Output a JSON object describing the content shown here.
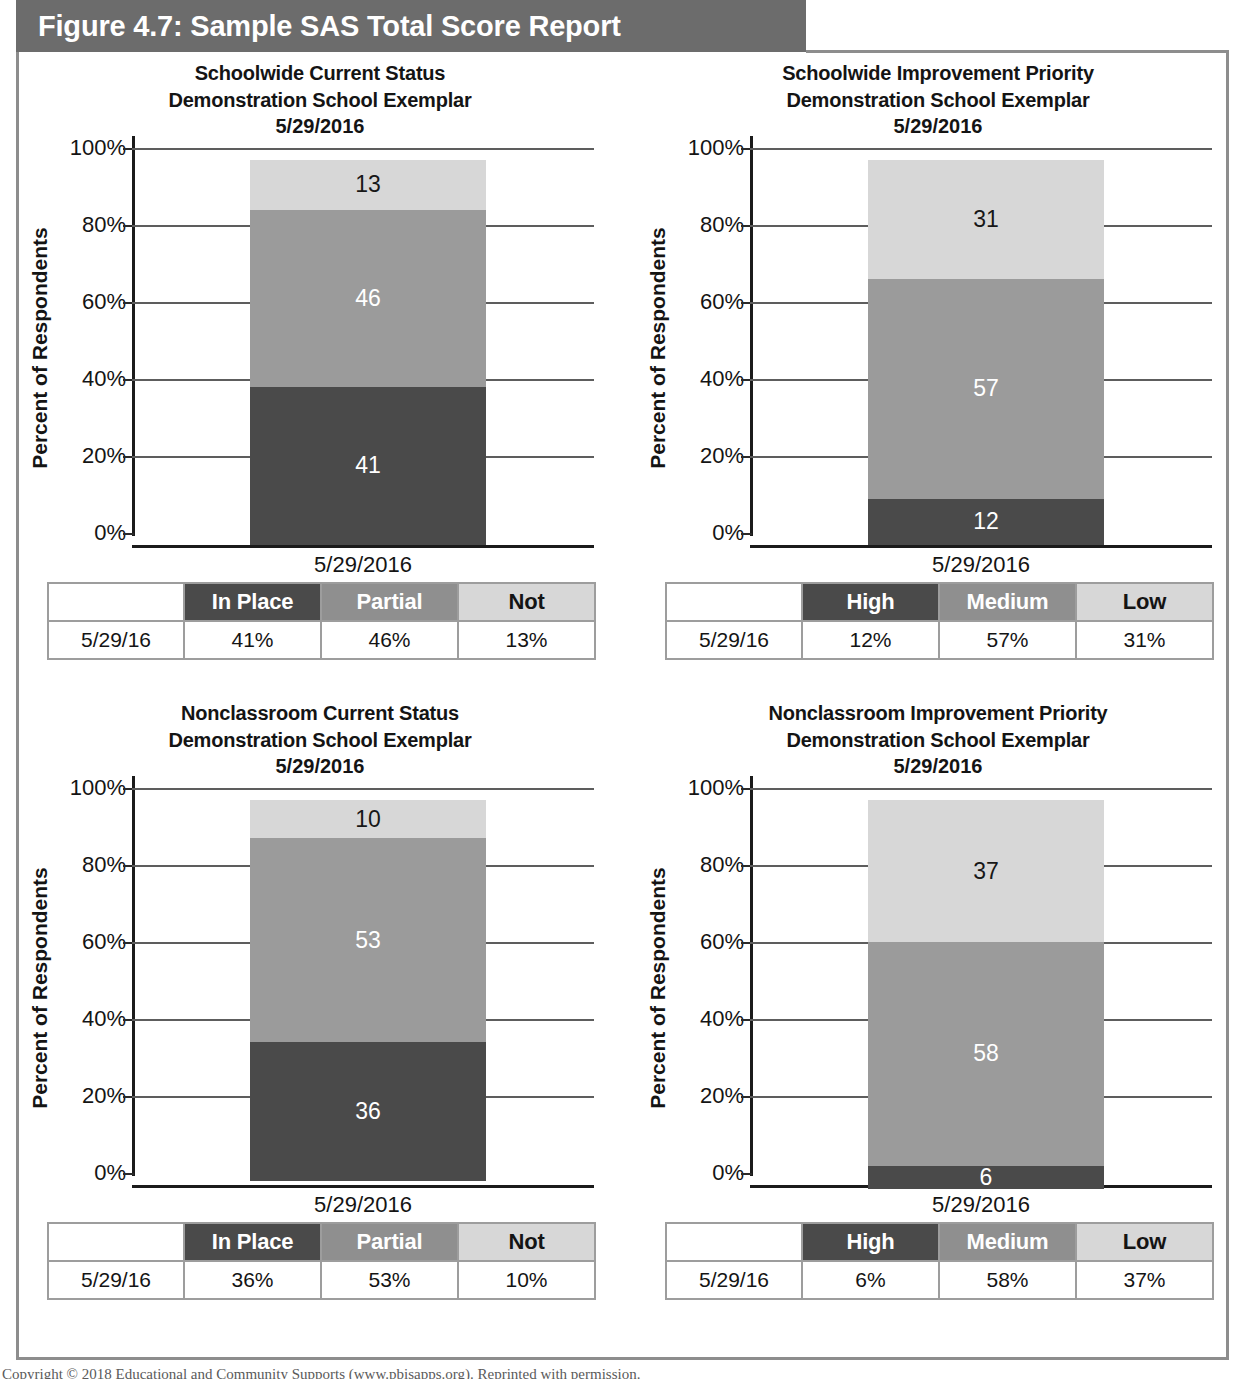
{
  "figure": {
    "banner_title": "Figure 4.7: Sample SAS Total Score Report",
    "footer": "Copyright © 2018 Educational and Community Supports (www.pbisapps.org). Reprinted with permission."
  },
  "colors": {
    "banner_bg": "#6c6c6c",
    "frame_border": "#8d8d8d",
    "segment_dark": "#4a4a4a",
    "segment_medium": "#9b9b9b",
    "segment_light": "#d7d7d7",
    "axis": "#1b1b1b",
    "gridline": "#5d5d5d",
    "text": "#141414"
  },
  "axis_common": {
    "ylabel": "Percent of Respondents",
    "tick_labels": [
      "100%",
      "80%",
      "60%",
      "40%",
      "20%",
      "0%"
    ],
    "tick_values": [
      100,
      80,
      60,
      40,
      20,
      0
    ]
  },
  "panels": [
    {
      "id": "schoolwide-current-status",
      "title_line1": "Schoolwide Current Status",
      "title_line2": "Demonstration School Exemplar",
      "title_line3": "5/29/2016",
      "xcat": "5/29/2016",
      "legend": {
        "row_label": "5/29/16",
        "headers": [
          "In Place",
          "Partial",
          "Not"
        ],
        "values": [
          "41%",
          "46%",
          "13%"
        ]
      }
    },
    {
      "id": "schoolwide-improvement-priority",
      "title_line1": "Schoolwide Improvement Priority",
      "title_line2": "Demonstration School Exemplar",
      "title_line3": "5/29/2016",
      "xcat": "5/29/2016",
      "legend": {
        "row_label": "5/29/16",
        "headers": [
          "High",
          "Medium",
          "Low"
        ],
        "values": [
          "12%",
          "57%",
          "31%"
        ]
      }
    },
    {
      "id": "nonclassroom-current-status",
      "title_line1": "Nonclassroom Current Status",
      "title_line2": "Demonstration School Exemplar",
      "title_line3": "5/29/2016",
      "xcat": "5/29/2016",
      "legend": {
        "row_label": "5/29/16",
        "headers": [
          "In Place",
          "Partial",
          "Not"
        ],
        "values": [
          "36%",
          "53%",
          "10%"
        ]
      }
    },
    {
      "id": "nonclassroom-improvement-priority",
      "title_line1": "Nonclassroom Improvement Priority",
      "title_line2": "Demonstration School Exemplar",
      "title_line3": "5/29/2016",
      "xcat": "5/29/2016",
      "legend": {
        "row_label": "5/29/16",
        "headers": [
          "High",
          "Medium",
          "Low"
        ],
        "values": [
          "6%",
          "58%",
          "37%"
        ]
      }
    }
  ],
  "chart_data": [
    {
      "type": "bar",
      "stacked": true,
      "percent": true,
      "title": "Schoolwide Current Status Demonstration School Exemplar 5/29/2016",
      "xlabel": "",
      "ylabel": "Percent of Respondents",
      "categories": [
        "5/29/2016"
      ],
      "ylim": [
        0,
        100
      ],
      "yticks": [
        0,
        20,
        40,
        60,
        80,
        100
      ],
      "ytick_labels": [
        "0%",
        "20%",
        "40%",
        "60%",
        "80%",
        "100%"
      ],
      "grid": true,
      "legend_position": "table-below",
      "series": [
        {
          "name": "In Place",
          "values": [
            41
          ],
          "label": "41",
          "color": "#4a4a4a",
          "label_color": "#ffffff"
        },
        {
          "name": "Partial",
          "values": [
            46
          ],
          "label": "46",
          "color": "#9b9b9b",
          "label_color": "#ffffff"
        },
        {
          "name": "Not",
          "values": [
            13
          ],
          "label": "13",
          "color": "#d7d7d7",
          "label_color": "#171717"
        }
      ]
    },
    {
      "type": "bar",
      "stacked": true,
      "percent": true,
      "title": "Schoolwide Improvement Priority Demonstration School Exemplar 5/29/2016",
      "xlabel": "",
      "ylabel": "Percent of Respondents",
      "categories": [
        "5/29/2016"
      ],
      "ylim": [
        0,
        100
      ],
      "yticks": [
        0,
        20,
        40,
        60,
        80,
        100
      ],
      "ytick_labels": [
        "0%",
        "20%",
        "40%",
        "60%",
        "80%",
        "100%"
      ],
      "grid": true,
      "legend_position": "table-below",
      "series": [
        {
          "name": "High",
          "values": [
            12
          ],
          "label": "12",
          "color": "#4a4a4a",
          "label_color": "#ffffff"
        },
        {
          "name": "Medium",
          "values": [
            57
          ],
          "label": "57",
          "color": "#9b9b9b",
          "label_color": "#ffffff"
        },
        {
          "name": "Low",
          "values": [
            31
          ],
          "label": "31",
          "color": "#d7d7d7",
          "label_color": "#171717"
        }
      ]
    },
    {
      "type": "bar",
      "stacked": true,
      "percent": true,
      "title": "Nonclassroom Current Status Demonstration School Exemplar 5/29/2016",
      "xlabel": "",
      "ylabel": "Percent of Respondents",
      "categories": [
        "5/29/2016"
      ],
      "ylim": [
        0,
        100
      ],
      "yticks": [
        0,
        20,
        40,
        60,
        80,
        100
      ],
      "ytick_labels": [
        "0%",
        "20%",
        "40%",
        "60%",
        "80%",
        "100%"
      ],
      "grid": true,
      "legend_position": "table-below",
      "series": [
        {
          "name": "In Place",
          "values": [
            36
          ],
          "label": "36",
          "color": "#4a4a4a",
          "label_color": "#ffffff"
        },
        {
          "name": "Partial",
          "values": [
            53
          ],
          "label": "53",
          "color": "#9b9b9b",
          "label_color": "#ffffff"
        },
        {
          "name": "Not",
          "values": [
            10
          ],
          "label": "10",
          "color": "#d7d7d7",
          "label_color": "#171717"
        }
      ]
    },
    {
      "type": "bar",
      "stacked": true,
      "percent": true,
      "title": "Nonclassroom Improvement Priority Demonstration School Exemplar 5/29/2016",
      "xlabel": "",
      "ylabel": "Percent of Respondents",
      "categories": [
        "5/29/2016"
      ],
      "ylim": [
        0,
        100
      ],
      "yticks": [
        0,
        20,
        40,
        60,
        80,
        100
      ],
      "ytick_labels": [
        "0%",
        "20%",
        "40%",
        "60%",
        "80%",
        "100%"
      ],
      "grid": true,
      "legend_position": "table-below",
      "series": [
        {
          "name": "High",
          "values": [
            6
          ],
          "label": "6",
          "color": "#4a4a4a",
          "label_color": "#ffffff"
        },
        {
          "name": "Medium",
          "values": [
            58
          ],
          "label": "58",
          "color": "#9b9b9b",
          "label_color": "#ffffff"
        },
        {
          "name": "Low",
          "values": [
            37
          ],
          "label": "37",
          "color": "#d7d7d7",
          "label_color": "#171717"
        }
      ]
    }
  ]
}
